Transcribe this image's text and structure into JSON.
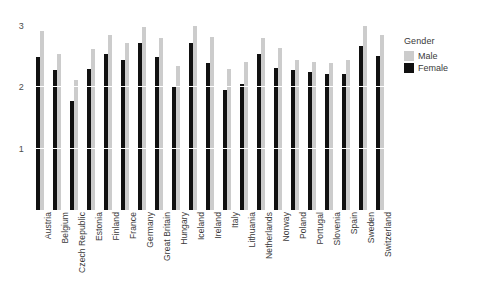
{
  "chart_data": {
    "type": "bar",
    "title": "",
    "subtitle": "",
    "xlabel": "",
    "ylabel": "",
    "grid": true,
    "gridline_color": "#ffffff",
    "background": "#ffffff",
    "ylim": [
      0,
      3.1
    ],
    "yticks": [
      1,
      2,
      3
    ],
    "ytick_labels": [
      "1",
      "2",
      "3"
    ],
    "legend": {
      "title": "Gender",
      "position": "right",
      "entries": [
        {
          "name": "Male",
          "color": "#cccccc"
        },
        {
          "name": "Female",
          "color": "#111111"
        }
      ]
    },
    "categories": [
      "Austria",
      "Belgium",
      "Czech Republic",
      "Estonia",
      "Finland",
      "France",
      "Germany",
      "Great Britain",
      "Hungary",
      "Iceland",
      "Ireland",
      "Italy",
      "Lithuania",
      "Netherlands",
      "Norway",
      "Poland",
      "Portugal",
      "Slovenia",
      "Spain",
      "Sweden",
      "Switzerland"
    ],
    "series": [
      {
        "name": "Male",
        "color": "#cccccc",
        "values": [
          2.92,
          2.55,
          2.12,
          2.62,
          2.85,
          2.72,
          2.98,
          2.8,
          2.35,
          3.02,
          2.82,
          2.3,
          2.42,
          2.8,
          2.65,
          2.45,
          2.42,
          2.4,
          2.45,
          3.0,
          2.85
        ]
      },
      {
        "name": "Female",
        "color": "#111111",
        "values": [
          2.5,
          2.28,
          1.78,
          2.3,
          2.55,
          2.45,
          2.72,
          2.5,
          2.02,
          2.72,
          2.4,
          1.95,
          2.05,
          2.55,
          2.32,
          2.28,
          2.25,
          2.22,
          2.22,
          2.68,
          2.52
        ]
      }
    ]
  }
}
